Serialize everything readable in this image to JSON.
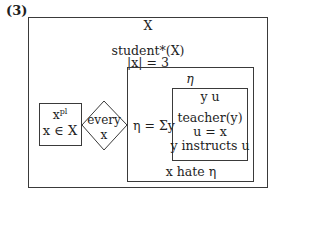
{
  "example_number": "(3)",
  "outer_box": {
    "referent": "X",
    "conditions": [
      "student*(X)",
      "|x| = 3"
    ]
  },
  "antecedent_box": {
    "referent": "x",
    "referent_superscript": "pl",
    "condition": "x ∈ X"
  },
  "quantifier": {
    "word": "every",
    "variable": "x"
  },
  "consequent_box": {
    "referent": "η",
    "abstraction": "η = Σy",
    "condition": "x hate η"
  },
  "inner_box": {
    "referents": "y  u",
    "conditions": [
      "teacher(y)",
      "u = x",
      "y instructs u"
    ]
  },
  "colors": {
    "line": "#3a3a3a",
    "text": "#1e1e1e",
    "background": "#ffffff"
  }
}
